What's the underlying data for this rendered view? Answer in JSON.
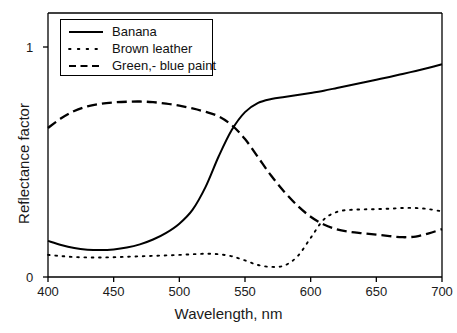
{
  "chart_data": {
    "type": "line",
    "title": "",
    "xlabel": "Wavelength, nm",
    "ylabel": "Reflectance factor",
    "xlim": [
      400,
      700
    ],
    "ylim": [
      0,
      1.12
    ],
    "xticks": [
      400,
      450,
      500,
      550,
      600,
      650,
      700
    ],
    "yticks": [
      0,
      1
    ],
    "xtick_labels": [
      "400",
      "450",
      "500",
      "550",
      "600",
      "650",
      "700"
    ],
    "ytick_labels": [
      "0",
      "1"
    ],
    "grid": false,
    "legend_position": "upper left",
    "x": [
      400,
      410,
      420,
      430,
      440,
      450,
      460,
      470,
      480,
      490,
      500,
      510,
      520,
      530,
      540,
      550,
      560,
      570,
      580,
      590,
      600,
      610,
      620,
      630,
      640,
      650,
      660,
      670,
      680,
      690,
      700
    ],
    "series": [
      {
        "name": "Banana",
        "style": "solid",
        "color": "#000000",
        "values": [
          0.157,
          0.139,
          0.126,
          0.119,
          0.117,
          0.12,
          0.128,
          0.142,
          0.163,
          0.192,
          0.232,
          0.292,
          0.392,
          0.525,
          0.64,
          0.717,
          0.757,
          0.774,
          0.783,
          0.791,
          0.8,
          0.81,
          0.822,
          0.834,
          0.846,
          0.858,
          0.87,
          0.883,
          0.896,
          0.91,
          0.925
        ]
      },
      {
        "name": "Brown leather",
        "style": "dotted",
        "color": "#000000",
        "values": [
          0.096,
          0.091,
          0.087,
          0.085,
          0.085,
          0.086,
          0.088,
          0.09,
          0.092,
          0.094,
          0.096,
          0.099,
          0.101,
          0.099,
          0.09,
          0.072,
          0.052,
          0.044,
          0.05,
          0.09,
          0.17,
          0.25,
          0.283,
          0.292,
          0.294,
          0.295,
          0.297,
          0.3,
          0.3,
          0.295,
          0.285
        ]
      },
      {
        "name": "Green,- blue paint",
        "style": "dashed",
        "color": "#000000",
        "values": [
          0.648,
          0.69,
          0.722,
          0.742,
          0.753,
          0.759,
          0.762,
          0.763,
          0.76,
          0.754,
          0.745,
          0.733,
          0.718,
          0.698,
          0.66,
          0.6,
          0.52,
          0.44,
          0.37,
          0.31,
          0.262,
          0.228,
          0.207,
          0.196,
          0.19,
          0.184,
          0.178,
          0.173,
          0.176,
          0.19,
          0.208
        ]
      }
    ]
  },
  "legend": {
    "items": [
      {
        "label": "Banana",
        "style": "solid"
      },
      {
        "label": "Brown leather",
        "style": "dotted"
      },
      {
        "label": "Green,- blue paint",
        "style": "dashed"
      }
    ]
  },
  "axes": {
    "x_title": "Wavelength, nm",
    "y_title": "Reflectance factor"
  }
}
